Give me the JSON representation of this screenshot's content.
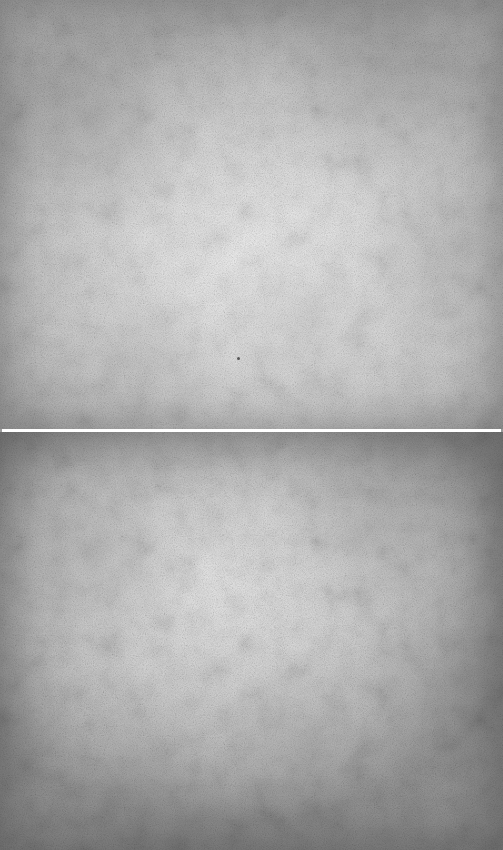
{
  "image": {
    "description": "Two stacked grey paper/parchment texture panels separated by a thin white horizontal line",
    "panels": [
      {
        "position": "top",
        "texture": "light grey paper",
        "center_color": "#f1f1f1",
        "edge_color": "#aeaeae"
      },
      {
        "position": "bottom",
        "texture": "grey paper with darker vignette",
        "center_color": "#e9e9e9",
        "edge_color": "#989898"
      }
    ],
    "divider": {
      "color": "#ffffff",
      "orientation": "horizontal"
    }
  }
}
